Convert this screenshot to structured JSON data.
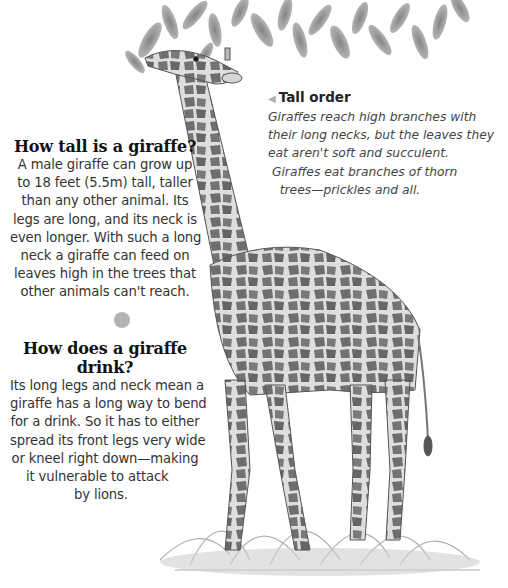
{
  "sections": [
    {
      "heading": "How tall is a giraffe?",
      "lines": [
        "A male giraffe can grow up",
        "to 18 feet (5.5m) tall, taller",
        "than any other animal. Its",
        "legs are long, and its neck is",
        "even longer. With such a long",
        "neck a giraffe can feed on",
        "leaves high in the trees that",
        "other animals can't reach."
      ]
    },
    {
      "heading_lines": [
        "How does a giraffe",
        "drink?"
      ],
      "lines": [
        "Its long legs and neck mean a",
        "giraffe has a long way to bend",
        "for a drink. So it has to either",
        "spread its front legs very wide",
        "or kneel right down—making",
        "it vulnerable to attack",
        "by lions."
      ]
    }
  ],
  "caption": {
    "title": "Tall order",
    "arrow_icon": "◀",
    "lines": [
      "Giraffes reach high branches with",
      "their long necks, but the leaves they",
      "eat aren't soft and succulent.",
      " Giraffes eat branches of thorn",
      "   trees—prickles and all."
    ]
  },
  "illustration": {
    "subject": "giraffe eating leaves from a tree",
    "colors": {
      "spot": "#6b6b6b",
      "coat": "#d9d9d9",
      "leaf": "#8a8a8a",
      "grass": "#9a9a9a"
    }
  }
}
